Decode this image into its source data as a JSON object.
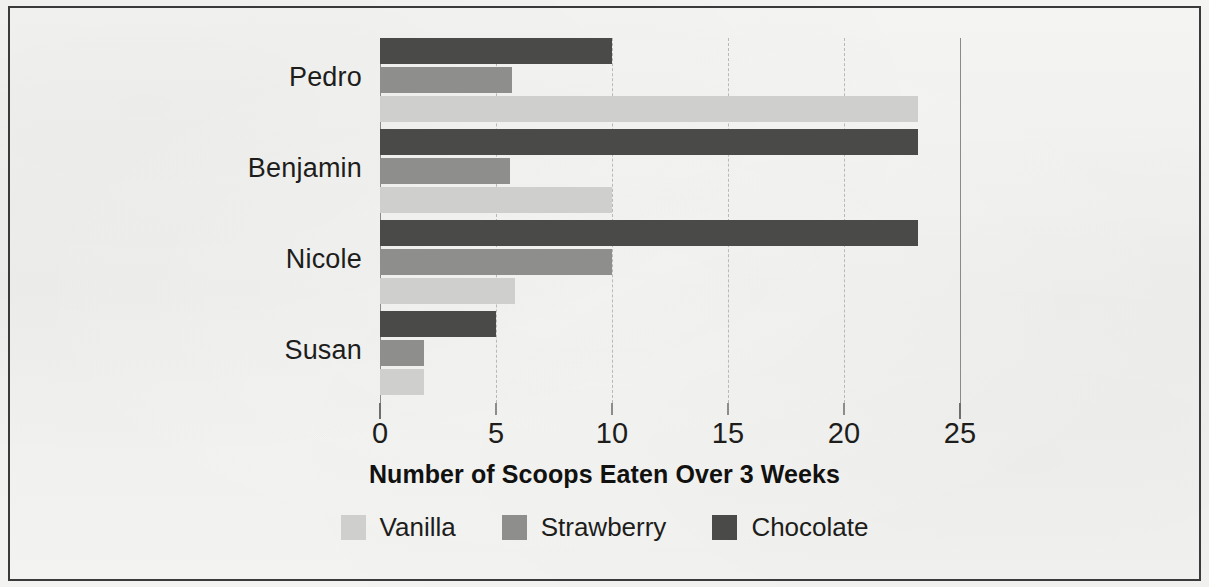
{
  "chart_data": {
    "type": "bar",
    "orientation": "horizontal",
    "title": "",
    "xlabel": "Number of Scoops Eaten Over 3 Weeks",
    "ylabel": "",
    "categories": [
      "Pedro",
      "Benjamin",
      "Nicole",
      "Susan"
    ],
    "series": [
      {
        "name": "Vanilla",
        "color": "#cfcfcd",
        "values": [
          23.2,
          10,
          5.8,
          1.9
        ]
      },
      {
        "name": "Strawberry",
        "color": "#8e8e8c",
        "values": [
          5.7,
          5.6,
          10,
          1.9
        ]
      },
      {
        "name": "Chocolate",
        "color": "#4a4a49",
        "values": [
          10,
          23.2,
          23.2,
          5
        ]
      }
    ],
    "xlim": [
      0,
      25
    ],
    "x_ticks": [
      0,
      5,
      10,
      15,
      20,
      25
    ],
    "x_tick_labels": [
      "0",
      "5",
      "10",
      "15",
      "20",
      "25"
    ],
    "grid": true,
    "grid_axis": "x",
    "grid_style": "dashed",
    "legend_position": "bottom",
    "series_order_top_to_bottom": [
      "Chocolate",
      "Strawberry",
      "Vanilla"
    ]
  },
  "axis": {
    "title": "Number of Scoops Eaten Over 3 Weeks",
    "tick_labels": [
      "0",
      "5",
      "10",
      "15",
      "20",
      "25"
    ]
  },
  "categories": [
    {
      "label": "Pedro"
    },
    {
      "label": "Benjamin"
    },
    {
      "label": "Nicole"
    },
    {
      "label": "Susan"
    }
  ],
  "legend": {
    "items": [
      {
        "label": "Vanilla",
        "color": "#cfcfcd"
      },
      {
        "label": "Strawberry",
        "color": "#8e8e8c"
      },
      {
        "label": "Chocolate",
        "color": "#4a4a49"
      }
    ]
  },
  "colors": {
    "vanilla": "#cfcfcd",
    "strawberry": "#8e8e8c",
    "chocolate": "#4a4a49",
    "background": "#f1f1ef",
    "border": "#3a3a3a",
    "text": "#1d1d1b",
    "gridline": "#b9b9b7"
  }
}
